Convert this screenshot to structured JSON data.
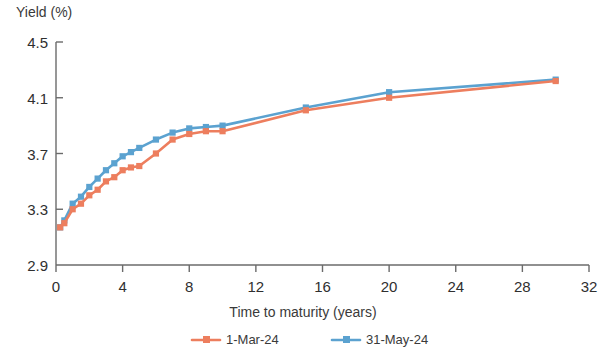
{
  "chart_data": {
    "type": "line",
    "title": "",
    "ylabel": "Yield (%)",
    "xlabel": "Time to maturity (years)",
    "xlim": [
      0,
      32
    ],
    "ylim": [
      2.9,
      4.5
    ],
    "xticks": [
      0,
      4,
      8,
      12,
      16,
      20,
      24,
      28,
      32
    ],
    "yticks": [
      2.9,
      3.3,
      3.7,
      4.1,
      4.5
    ],
    "xtick_labels": [
      "0",
      "4",
      "8",
      "12",
      "16",
      "20",
      "24",
      "28",
      "32"
    ],
    "ytick_labels": [
      "2.9",
      "3.3",
      "3.7",
      "4.1",
      "4.5"
    ],
    "grid": false,
    "legend_position": "bottom",
    "marker": "square",
    "series": [
      {
        "name": "1-Mar-24",
        "color": "#ED7E5E",
        "x": [
          0.25,
          0.5,
          1,
          1.5,
          2,
          2.5,
          3,
          3.5,
          4,
          4.5,
          5,
          6,
          7,
          8,
          9,
          10,
          15,
          20,
          30
        ],
        "values": [
          3.17,
          3.2,
          3.3,
          3.34,
          3.4,
          3.44,
          3.5,
          3.53,
          3.58,
          3.6,
          3.61,
          3.7,
          3.8,
          3.84,
          3.86,
          3.86,
          4.01,
          4.1,
          4.22
        ]
      },
      {
        "name": "31-May-24",
        "color": "#5BA2D0",
        "x": [
          0.25,
          0.5,
          1,
          1.5,
          2,
          2.5,
          3,
          3.5,
          4,
          4.5,
          5,
          6,
          7,
          8,
          9,
          10,
          15,
          20,
          30
        ],
        "values": [
          3.17,
          3.22,
          3.34,
          3.39,
          3.46,
          3.52,
          3.58,
          3.63,
          3.68,
          3.71,
          3.74,
          3.8,
          3.85,
          3.88,
          3.89,
          3.9,
          4.03,
          4.14,
          4.23
        ]
      }
    ]
  },
  "legend": {
    "items": [
      {
        "label": "1-Mar-24",
        "color": "#ED7E5E"
      },
      {
        "label": "31-May-24",
        "color": "#5BA2D0"
      }
    ]
  }
}
